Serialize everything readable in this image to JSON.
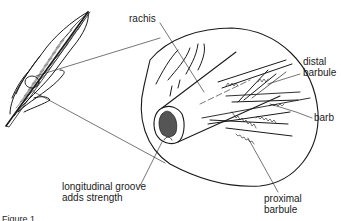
{
  "diagram": {
    "type": "labeled-illustration",
    "labels": {
      "rachis": "rachis",
      "distal_barbule_line1": "distal",
      "distal_barbule_line2": "barbule",
      "barb": "barb",
      "groove_line1": "longitudinal groove",
      "groove_line2": "adds strength",
      "proximal_barbule_line1": "proximal",
      "proximal_barbule_line2": "barbule"
    },
    "caption": "Figure 1 ..."
  },
  "colors": {
    "ink": "#1a1a1a",
    "background": "#ffffff",
    "marrow": "#555555"
  }
}
